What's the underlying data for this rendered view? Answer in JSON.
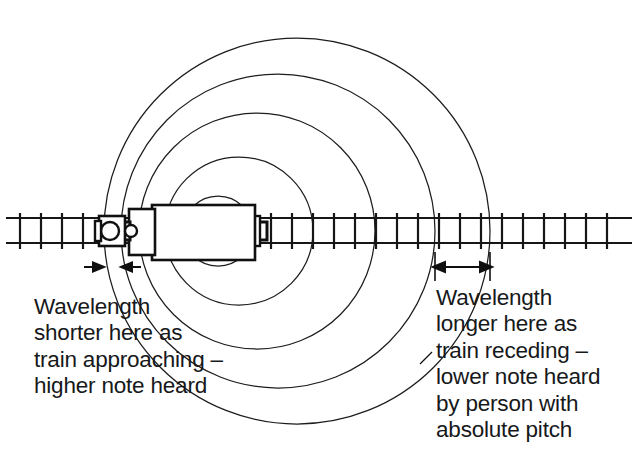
{
  "figure": {
    "direction_of_travel": "left",
    "background_color": "#ffffff",
    "line_color": "#1a1a1a"
  },
  "captions": {
    "left": {
      "name": "wavelength-shorter-caption",
      "lines": [
        "Wavelength",
        "shorter here as",
        "train approaching –",
        "higher note heard"
      ]
    },
    "right": {
      "name": "wavelength-longer-caption",
      "lines": [
        "Wavelength",
        "longer here as",
        "train receding –",
        "lower note heard",
        "by person with",
        "absolute pitch"
      ]
    }
  },
  "annotations": {
    "left_measure_label": "short wavelength span",
    "right_measure_label": "long wavelength span"
  },
  "diagram_data": {
    "type": "schematic",
    "track": {
      "x_start": 6,
      "x_end": 632,
      "rail_top_y": 218,
      "rail_bottom_y": 243,
      "sleeper_spacing": 21
    },
    "train": {
      "center_x": 218,
      "body_left": 133,
      "body_right": 258,
      "cab_left": 107,
      "wheels": [
        {
          "cx": 118,
          "cy": 231,
          "r": 9
        },
        {
          "cx": 137,
          "cy": 231,
          "r": 6
        }
      ]
    },
    "wavefronts": [
      {
        "index": 1,
        "center_x": 218,
        "center_y": 231,
        "radius": 35,
        "left_crossing": 183,
        "right_crossing": 253
      },
      {
        "index": 2,
        "center_x": 239,
        "center_y": 231,
        "radius": 74,
        "left_crossing": 165,
        "right_crossing": 313
      },
      {
        "index": 3,
        "center_x": 257,
        "center_y": 231,
        "radius": 118,
        "left_crossing": 139,
        "right_crossing": 375
      },
      {
        "index": 4,
        "center_x": 278,
        "center_y": 231,
        "radius": 157,
        "left_crossing": 121,
        "right_crossing": 435
      },
      {
        "index": 5,
        "center_x": 297,
        "center_y": 231,
        "radius": 193,
        "left_crossing": 104,
        "right_crossing": 490
      }
    ],
    "left_wavelength_span": {
      "from": 104,
      "to": 121,
      "arrow_y": 267
    },
    "right_wavelength_span": {
      "from": 435,
      "to": 490,
      "arrow_y": 267
    }
  }
}
